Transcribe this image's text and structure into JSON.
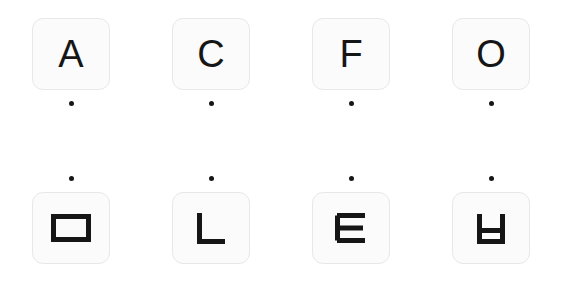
{
  "canvas": {
    "width": 563,
    "height": 291,
    "background_color": "#ffffff"
  },
  "style": {
    "tile_fill": "#fbfbfb",
    "tile_border": "#e8e8e8",
    "glyph_color": "#161616",
    "dot_color": "#161616"
  },
  "rows": [
    {
      "id": "row-top",
      "dot_position": "below",
      "cells": [
        {
          "glyph_label": "A",
          "glyph_kind": "letter",
          "icon_name": "letter-a-glyph",
          "dot_label": "marker-dot"
        },
        {
          "glyph_label": "C",
          "glyph_kind": "letter",
          "icon_name": "letter-c-glyph",
          "dot_label": "marker-dot"
        },
        {
          "glyph_label": "F",
          "glyph_kind": "letter",
          "icon_name": "letter-f-glyph",
          "dot_label": "marker-dot"
        },
        {
          "glyph_label": "O",
          "glyph_kind": "letter",
          "icon_name": "letter-o-glyph",
          "dot_label": "marker-dot"
        }
      ]
    },
    {
      "id": "row-bottom",
      "dot_position": "above",
      "cells": [
        {
          "glyph_label": "▭",
          "glyph_kind": "shape",
          "icon_name": "rectangle-outline-glyph",
          "dot_label": "marker-dot"
        },
        {
          "glyph_label": "└",
          "glyph_kind": "shape",
          "icon_name": "corner-l-glyph",
          "dot_label": "marker-dot"
        },
        {
          "glyph_label": "≡",
          "glyph_kind": "shape",
          "icon_name": "e-bars-glyph",
          "dot_label": "marker-dot"
        },
        {
          "glyph_label": "ㅂ",
          "glyph_kind": "shape",
          "icon_name": "rotated-h-glyph",
          "dot_label": "marker-dot"
        }
      ]
    }
  ]
}
